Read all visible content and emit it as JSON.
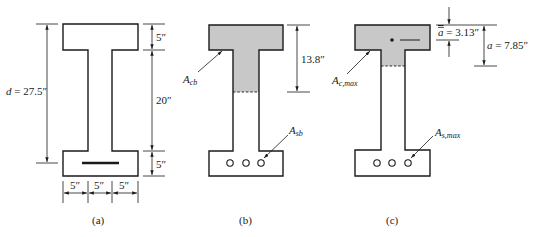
{
  "figure_a": {
    "caption": "(a)",
    "depth_label_var": "d",
    "depth_label_value": " = 27.5″",
    "top_flange_dim": "5″",
    "web_height_dim": "20″",
    "bottom_flange_dim": "5″",
    "width_dims": [
      "5″",
      "5″",
      "5″"
    ]
  },
  "figure_b": {
    "caption": "(b)",
    "compression_area_label": "A",
    "compression_area_sub": "cb",
    "steel_area_label": "A",
    "steel_area_sub": "sb",
    "depth_dim": "13.8″",
    "bar_count": 3
  },
  "figure_c": {
    "caption": "(c)",
    "compression_area_label": "A",
    "compression_area_sub": "c,max",
    "steel_area_label": "A",
    "steel_area_sub": "s,max",
    "centroid_dim_var": "a",
    "centroid_dim_value": " = 3.13″",
    "block_depth_var": "a",
    "block_depth_value": " = 7.85″",
    "bar_count": 3
  },
  "colors": {
    "line": "#1a1a1a",
    "shade": "#c8c8c8",
    "background": "#ffffff"
  }
}
